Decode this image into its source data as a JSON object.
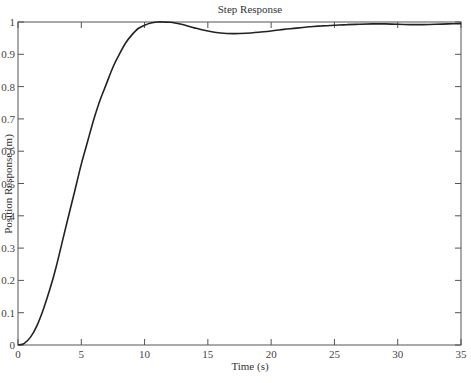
{
  "chart_data": {
    "type": "line",
    "title": "Step Response",
    "xlabel": "Time (s)",
    "ylabel": "Position Response (m)",
    "xlim": [
      0,
      35
    ],
    "ylim": [
      0,
      1
    ],
    "xticks": [
      0,
      5,
      10,
      15,
      20,
      25,
      30,
      35
    ],
    "yticks": [
      0,
      0.1,
      0.2,
      0.3,
      0.4,
      0.5,
      0.6,
      0.7,
      0.8,
      0.9,
      1
    ],
    "ytick_labels": [
      "0",
      "0.1",
      "0.2",
      "0.3",
      "0.4",
      "0.5",
      "0.6",
      "0.7",
      "0.8",
      "0.9",
      "1"
    ],
    "grid": false,
    "legend": null,
    "series": [
      {
        "name": "Step Response",
        "x": [
          0,
          0.5,
          1,
          1.5,
          2,
          2.5,
          3,
          3.5,
          4,
          4.5,
          5,
          5.5,
          6,
          6.5,
          7,
          7.5,
          8,
          8.5,
          9,
          9.5,
          10,
          10.5,
          11,
          11.5,
          12,
          12.5,
          13,
          14,
          15,
          16,
          17,
          18,
          19,
          20,
          21,
          22,
          23,
          24,
          25,
          26,
          27,
          28,
          29,
          30,
          31,
          32,
          33,
          34,
          35
        ],
        "y": [
          0,
          0.005,
          0.025,
          0.06,
          0.11,
          0.17,
          0.24,
          0.32,
          0.4,
          0.48,
          0.56,
          0.63,
          0.7,
          0.76,
          0.81,
          0.86,
          0.9,
          0.935,
          0.96,
          0.98,
          0.99,
          0.997,
          1.0,
          1.0,
          0.999,
          0.996,
          0.992,
          0.981,
          0.972,
          0.966,
          0.964,
          0.965,
          0.968,
          0.972,
          0.977,
          0.981,
          0.985,
          0.988,
          0.99,
          0.992,
          0.993,
          0.994,
          0.994,
          0.993,
          0.992,
          0.992,
          0.993,
          0.994,
          0.995
        ]
      }
    ]
  }
}
